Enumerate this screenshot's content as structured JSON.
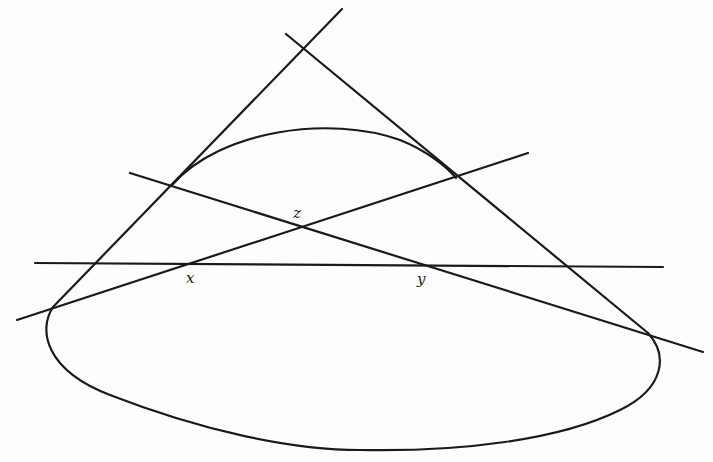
{
  "diagram": {
    "type": "projective-geometry-figure",
    "labels": {
      "x": "x",
      "y": "y",
      "z": "z"
    },
    "lines": [
      {
        "name": "left-tangent",
        "from": [
          53,
          307
        ],
        "to": [
          342,
          9
        ]
      },
      {
        "name": "right-tangent",
        "from": [
          286,
          34
        ],
        "to": [
          648,
          333
        ]
      },
      {
        "name": "line-through-x-z",
        "from": [
          17,
          320
        ],
        "to": [
          528,
          153
        ]
      },
      {
        "name": "line-through-z-y",
        "from": [
          130,
          173
        ],
        "to": [
          703,
          352
        ]
      },
      {
        "name": "horizontal-line-x-y",
        "from": [
          35,
          263
        ],
        "to": [
          663,
          268
        ]
      }
    ],
    "colors": {
      "stroke": "#1a1a1a",
      "background": "#fdfdfd"
    }
  }
}
